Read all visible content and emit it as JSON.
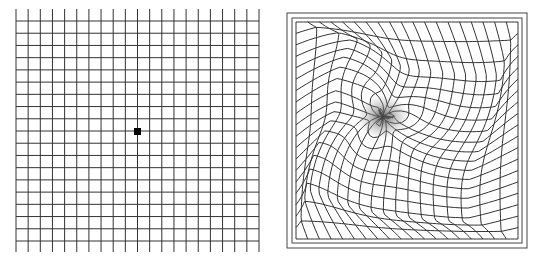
{
  "figure": {
    "left_panel": {
      "label": "normal-amsler-grid",
      "x0": 16,
      "x1": 259,
      "cols": 20,
      "h_y0": 21,
      "h_y1": 241,
      "rows": 18,
      "v_y0": 9,
      "v_y1": 252,
      "h_x0": 16,
      "h_x1": 259,
      "line_color": "#333333",
      "center_dot": {
        "x": 134,
        "y": 128,
        "size": 7,
        "color": "#000000"
      }
    },
    "right_panel": {
      "label": "distorted-amsler-grid",
      "outer_frame": {
        "x": 287,
        "y": 13,
        "w": 240,
        "h": 235
      },
      "inner_frame": {
        "x": 292,
        "y": 18,
        "w": 230,
        "h": 225
      },
      "grid": {
        "x0": 296,
        "x1": 518,
        "y0": 22,
        "y1": 239,
        "cols": 19,
        "rows": 19
      },
      "distortion_center": {
        "x": 383,
        "y": 117
      },
      "line_color": "#333333",
      "blur_color": "#555555"
    }
  }
}
